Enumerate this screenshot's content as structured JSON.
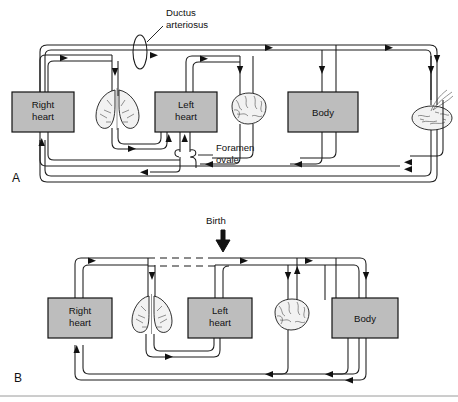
{
  "figure": {
    "panels": [
      {
        "id": "A",
        "letter": "A",
        "caption_label": "A",
        "description": "Fetal circulation with ductus arteriosus, foramen ovale and placenta",
        "organs": [
          {
            "name": "right-heart",
            "label_line1": "Right",
            "label_line2": "heart"
          },
          {
            "name": "lungs",
            "label_line1": "",
            "label_line2": ""
          },
          {
            "name": "left-heart",
            "label_line1": "Left",
            "label_line2": "heart"
          },
          {
            "name": "brain",
            "label_line1": "",
            "label_line2": ""
          },
          {
            "name": "body",
            "label_line1": "Body",
            "label_line2": ""
          },
          {
            "name": "placenta",
            "label_line1": "",
            "label_line2": ""
          }
        ],
        "annotations": [
          {
            "name": "ductus-arteriosus",
            "line1": "Ductus",
            "line2": "arteriosus"
          },
          {
            "name": "foramen-ovale",
            "line1": "Foramen",
            "line2": "ovale"
          }
        ]
      },
      {
        "id": "B",
        "letter": "B",
        "caption_label": "B",
        "description": "Postnatal circulation after birth; ductus arteriosus closed shown as dashed line",
        "organs": [
          {
            "name": "right-heart",
            "label_line1": "Right",
            "label_line2": "heart"
          },
          {
            "name": "lungs",
            "label_line1": "",
            "label_line2": ""
          },
          {
            "name": "left-heart",
            "label_line1": "Left",
            "label_line2": "heart"
          },
          {
            "name": "brain",
            "label_line1": "",
            "label_line2": ""
          },
          {
            "name": "body",
            "label_line1": "Body",
            "label_line2": ""
          }
        ],
        "annotations": [
          {
            "name": "birth",
            "line1": "Birth",
            "line2": ""
          }
        ]
      }
    ],
    "colors": {
      "organ_fill": "#bdbdbd",
      "organ_stroke": "#111111",
      "vessel_stroke": "#1a1a1a",
      "background": "#ffffff",
      "tissue_fill": "#f2f2f2"
    }
  },
  "panelA": {
    "right_heart_line1": "Right",
    "right_heart_line2": "heart",
    "left_heart_line1": "Left",
    "left_heart_line2": "heart",
    "body_label": "Body",
    "ductus_line1": "Ductus",
    "ductus_line2": "arteriosus",
    "foramen_line1": "Foramen",
    "foramen_line2": "ovale",
    "letter": "A"
  },
  "panelB": {
    "right_heart_line1": "Right",
    "right_heart_line2": "heart",
    "left_heart_line1": "Left",
    "left_heart_line2": "heart",
    "body_label": "Body",
    "birth_label": "Birth",
    "letter": "B"
  }
}
